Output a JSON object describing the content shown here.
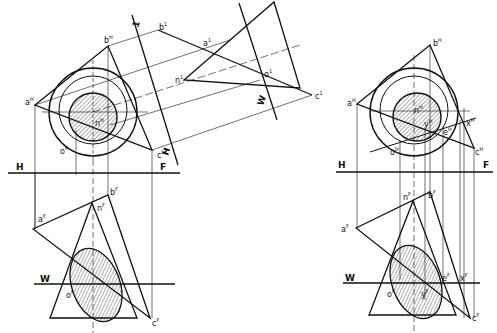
{
  "figure": {
    "colors": {
      "line": "#111111",
      "background": "#ffffff",
      "hatch": "#333333"
    }
  },
  "left_figure": {
    "fold_lines": {
      "hf_left": "H",
      "hf_right": "F",
      "fw": "W",
      "h1": "H",
      "h1_sub": "1",
      "aux_1": "1",
      "aux_w": "W"
    },
    "top_view_labels": {
      "a": "a",
      "a_sup": "H",
      "b": "b",
      "b_sup": "H",
      "c": "c",
      "c_sup": "H",
      "n": "n",
      "n_sup": "H",
      "o": "o",
      "o_sup": "H"
    },
    "front_view_labels": {
      "a": "a",
      "a_sup": "F",
      "b": "b",
      "b_sup": "F",
      "c": "c",
      "c_sup": "F",
      "n": "n",
      "n_sup": "F",
      "o": "o",
      "o_sup": "F"
    },
    "aux_view_labels": {
      "b": "b",
      "b_sup": "1",
      "a": "a",
      "a_sup": "1",
      "n": "n",
      "n_sup": "1",
      "o": "o",
      "o_sup": "1",
      "c": "c",
      "c_sup": "1"
    }
  },
  "right_figure": {
    "fold_lines": {
      "hf_left": "H",
      "hf_right": "F",
      "fw": "W"
    },
    "top_view_labels": {
      "a": "a",
      "a_sup": "H",
      "b": "b",
      "b_sup": "H",
      "c": "c",
      "c_sup": "H",
      "n": "n",
      "n_sup": "H",
      "o": "o",
      "o_sup": "H",
      "x": "x",
      "x_sup": "H",
      "y": "y",
      "y_sup": "H",
      "e": "e",
      "e_sup": "H"
    },
    "front_view_labels": {
      "a": "a",
      "a_sup": "F",
      "b": "b",
      "b_sup": "F",
      "c": "c",
      "c_sup": "F",
      "n": "n",
      "n_sup": "F",
      "o": "o",
      "o_sup": "F",
      "e": "e",
      "e_sup": "F",
      "x": "x",
      "x_sup": "F",
      "y": "y",
      "y_sup": "F"
    }
  }
}
